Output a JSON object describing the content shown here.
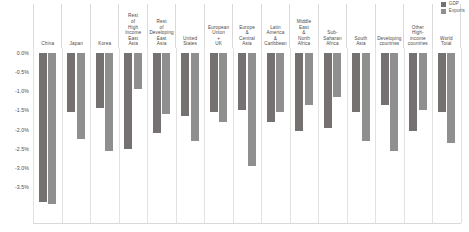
{
  "legend": {
    "position": "top-right",
    "items": [
      {
        "label": "GDP",
        "color": "#767171"
      },
      {
        "label": "Exports",
        "color": "#8f8f8f"
      }
    ]
  },
  "axis": {
    "y_ticks": [
      "0.0%",
      "-0.5%",
      "-1.0%",
      "-1.5%",
      "-2.0%",
      "-2.5%",
      "-3.0%",
      "-3.5%"
    ]
  },
  "chart_data": {
    "type": "bar",
    "title": "",
    "subtitle": "",
    "xlabel": "",
    "ylabel": "",
    "ylim": [
      -4.0,
      0.0
    ],
    "grid": false,
    "legend_position": "top-right",
    "categories": [
      "China",
      "Japan",
      "Korea",
      "Rest of High Income East Asia",
      "Rest of Developing East Asia",
      "United States",
      "European Union + UK",
      "Europe & Central Asia",
      "Latin America & Caribbean",
      "Middle East & North Africa",
      "Sub-Saharan Africa",
      "South Asia",
      "Developing countries",
      "Other High-income countries",
      "World Total"
    ],
    "series": [
      {
        "name": "GDP",
        "color": "#767171",
        "values": [
          -3.9,
          -1.55,
          -1.45,
          -2.5,
          -2.1,
          -1.65,
          -1.55,
          -1.5,
          -1.8,
          -2.05,
          -1.95,
          -1.55,
          -1.35,
          -2.05,
          -1.55
        ]
      },
      {
        "name": "Exports",
        "color": "#8f8f8f",
        "values": [
          -3.95,
          -2.25,
          -2.55,
          -0.95,
          -1.6,
          -2.3,
          -1.8,
          -2.95,
          -1.55,
          -1.35,
          -1.15,
          -2.3,
          -2.55,
          -1.5,
          -2.35
        ]
      }
    ]
  }
}
